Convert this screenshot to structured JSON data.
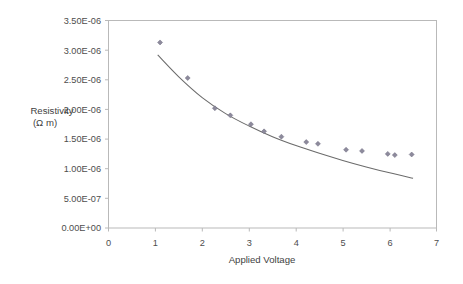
{
  "chart_data": {
    "type": "scatter",
    "title": "",
    "xlabel": "Applied Voltage",
    "ylabel": "Resistivity\n(Ω m)",
    "ylabel_line1": "Resistivity",
    "ylabel_line2": "(Ω m)",
    "xlim": [
      0,
      7
    ],
    "ylim": [
      0,
      3.5e-06
    ],
    "grid": false,
    "legend": false,
    "legend_position": "none",
    "xticks": [
      0,
      1,
      2,
      3,
      4,
      5,
      6,
      7
    ],
    "xticklabels": [
      "0",
      "1",
      "2",
      "3",
      "4",
      "5",
      "6",
      "7"
    ],
    "yticks": [
      0,
      5e-07,
      1e-06,
      1.5e-06,
      2e-06,
      2.5e-06,
      3e-06,
      3.5e-06
    ],
    "yticklabels": [
      "0.00E+00",
      "5.00E-07",
      "1.00E-06",
      "1.50E-06",
      "2.00E-06",
      "2.50E-06",
      "3.00E-06",
      "3.50E-06"
    ],
    "marker_color": "#8d8a9c",
    "curve_color": "#6b6b6b",
    "frame_color": "#b9b9b9",
    "series": [
      {
        "name": "Measured resistivity",
        "marker": "diamond",
        "x": [
          1.1,
          1.69,
          2.27,
          2.6,
          3.04,
          3.32,
          3.69,
          4.22,
          4.47,
          5.07,
          5.41,
          5.96,
          6.11,
          6.47
        ],
        "y": [
          3.13e-06,
          2.53e-06,
          2.02e-06,
          1.9e-06,
          1.75e-06,
          1.63e-06,
          1.54e-06,
          1.45e-06,
          1.42e-06,
          1.32e-06,
          1.3e-06,
          1.25e-06,
          1.23e-06,
          1.24e-06
        ]
      },
      {
        "name": "Fitted trend curve",
        "marker": "none",
        "x": [
          1.05,
          1.5,
          2.0,
          2.5,
          3.0,
          3.5,
          4.0,
          4.5,
          5.0,
          5.5,
          6.0,
          6.5
        ],
        "y": [
          2.92e-06,
          2.55e-06,
          2.2e-06,
          1.93e-06,
          1.72e-06,
          1.54e-06,
          1.39e-06,
          1.26e-06,
          1.14e-06,
          1.03e-06,
          9.3e-07,
          8.4e-07
        ]
      }
    ]
  }
}
